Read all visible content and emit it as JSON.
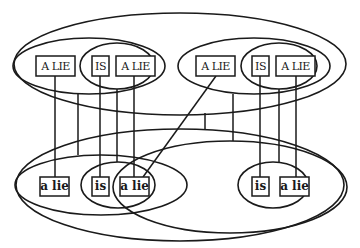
{
  "diagram": {
    "type": "nested-ellipse-alignment-diagram",
    "colors": {
      "stroke": "#1a1a1a",
      "background": "#ffffff"
    },
    "top_row": {
      "left_group": {
        "boxes": [
          {
            "label": "A LIE"
          },
          {
            "label": "IS"
          },
          {
            "label": "A LIE"
          }
        ]
      },
      "right_group": {
        "boxes": [
          {
            "label": "A LIE"
          },
          {
            "label": "IS"
          },
          {
            "label": "A LIE"
          }
        ]
      }
    },
    "bottom_row": {
      "left_group": {
        "boxes": [
          {
            "label": "a lie"
          },
          {
            "label": "is"
          },
          {
            "label": "a lie"
          }
        ]
      },
      "right_group": {
        "boxes": [
          {
            "label": "is"
          },
          {
            "label": "a lie"
          }
        ]
      }
    }
  }
}
